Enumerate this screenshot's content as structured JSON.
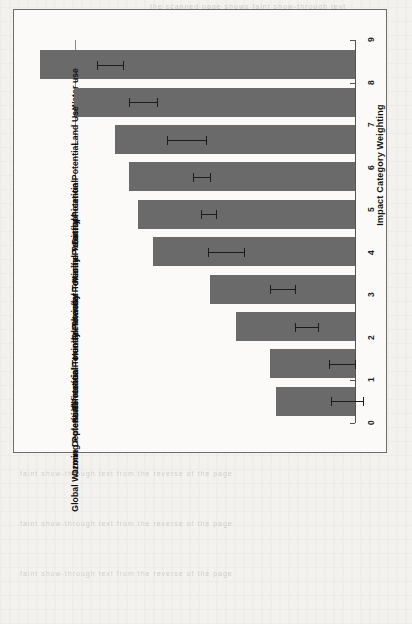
{
  "figure": {
    "orientation": "rotated-90",
    "axis_title": "Impact Category Weighting",
    "bar_color": "#6a6a6a",
    "error_color": "#1b1b1b",
    "frame_color": "#6d6d6d",
    "background": "#fbfaf8"
  },
  "chart_data": {
    "type": "bar",
    "title": "",
    "xlabel": "",
    "ylabel": "Impact Category Weighting",
    "ylim": [
      0,
      9
    ],
    "ticks": [
      0,
      1,
      2,
      3,
      4,
      5,
      6,
      7,
      8,
      9
    ],
    "grid": false,
    "legend": "none",
    "categories": [
      "Water use",
      "Land Use",
      "Eutrophication Potential",
      "Marine Toxicity Potential",
      "Freshwater Toxicity Potential",
      "Human Toxicity Potential",
      "Terrestrial Toxicity Potential",
      "Acidification Potential",
      "Ozone Depletion Potential",
      "Global Warming Potential"
    ],
    "values": [
      7.4,
      6.6,
      5.65,
      5.3,
      5.1,
      4.75,
      3.4,
      2.8,
      2.0,
      1.85
    ],
    "error_low": [
      7.15,
      6.35,
      5.2,
      5.1,
      4.95,
      4.3,
      3.1,
      2.55,
      1.7,
      1.5
    ],
    "error_high": [
      7.75,
      7.0,
      6.1,
      5.5,
      5.3,
      5.15,
      3.7,
      3.1,
      2.3,
      2.25
    ]
  },
  "bleed_text": {
    "top": "the scanned page shows faint show-through text",
    "bottom": "faint show-through text from the reverse of the page"
  }
}
